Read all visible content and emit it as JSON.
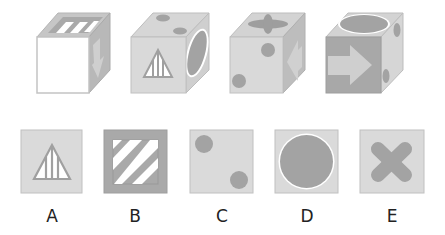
{
  "puzzle": {
    "cubes": [
      {
        "front": "blank-white",
        "top": "diagonal-stripes",
        "right": "arrow-down"
      },
      {
        "front": "striped-triangle",
        "top": "two-dots",
        "right": "large-circle"
      },
      {
        "front": "two-dots",
        "top": "cross",
        "right": "arrow-left"
      },
      {
        "front": "arrow-right",
        "top": "large-circle",
        "right": "two-dots"
      }
    ],
    "options": [
      {
        "label": "A",
        "face": "striped-triangle"
      },
      {
        "label": "B",
        "face": "diagonal-stripes"
      },
      {
        "label": "C",
        "face": "two-dots"
      },
      {
        "label": "D",
        "face": "large-circle"
      },
      {
        "label": "E",
        "face": "cross"
      }
    ]
  },
  "colors": {
    "face": "#d9d9d9",
    "dark": "#a8a8a8",
    "shape": "#9a9a9a",
    "edge": "#bdbdbd",
    "white": "#ffffff"
  }
}
